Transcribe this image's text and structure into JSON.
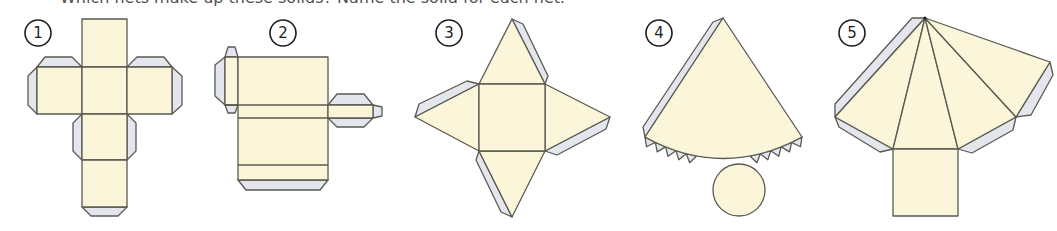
{
  "caption": "Which nets make up these solids? Name the solid for each net.",
  "colors": {
    "face": "#fbf6d9",
    "flap": "#e3e6ec",
    "outline": "#5a5a52",
    "badge": "#1e1e1e"
  },
  "nets": [
    {
      "number": "1",
      "shape": "cube net with glue flaps"
    },
    {
      "number": "2",
      "shape": "cuboid net with glue flaps"
    },
    {
      "number": "3",
      "shape": "square-based pyramid net with glue flaps"
    },
    {
      "number": "4",
      "shape": "cone net with glue tabs and circular base"
    },
    {
      "number": "5",
      "shape": "square-based pyramid (fan layout) net with glue flaps"
    }
  ]
}
